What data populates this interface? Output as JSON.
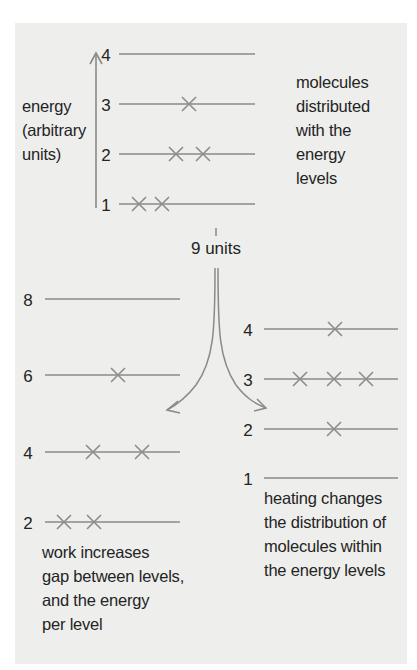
{
  "colors": {
    "panel_background": "#eeeeed",
    "line_color": "#8a8a8a",
    "text_color": "#242424"
  },
  "top_diagram": {
    "axis_label": [
      "energy",
      "(arbitrary",
      "units)"
    ],
    "description": [
      "molecules",
      "distributed",
      "with the",
      "energy",
      "levels"
    ],
    "levels": [
      {
        "label": "4",
        "y": 54,
        "molecules": []
      },
      {
        "label": "3",
        "y": 104,
        "molecules": [
          189
        ]
      },
      {
        "label": "2",
        "y": 154,
        "molecules": [
          176,
          203
        ]
      },
      {
        "label": "1",
        "y": 204,
        "molecules": [
          139,
          162
        ]
      }
    ],
    "line_x": [
      119,
      255
    ],
    "label_x": 106
  },
  "transfer": {
    "label": "9 units"
  },
  "work_diagram": {
    "description": [
      "work increases",
      "gap between levels,",
      "and the energy",
      "per level"
    ],
    "levels": [
      {
        "label": "8",
        "y": 299,
        "molecules": []
      },
      {
        "label": "6",
        "y": 375,
        "molecules": [
          118
        ]
      },
      {
        "label": "4",
        "y": 452,
        "molecules": [
          93,
          142
        ]
      },
      {
        "label": "2",
        "y": 522,
        "molecules": [
          64,
          94
        ]
      }
    ],
    "line_x": [
      45,
      180
    ],
    "label_x": 28
  },
  "heating_diagram": {
    "description": [
      "heating changes",
      "the distribution of",
      "molecules within",
      "the energy levels"
    ],
    "levels": [
      {
        "label": "4",
        "y": 329,
        "molecules": [
          335
        ]
      },
      {
        "label": "3",
        "y": 379,
        "molecules": [
          300,
          334,
          366
        ]
      },
      {
        "label": "2",
        "y": 429,
        "molecules": [
          334
        ]
      },
      {
        "label": "1",
        "y": 478,
        "molecules": []
      }
    ],
    "line_x": [
      264,
      398
    ],
    "label_x": 248
  }
}
